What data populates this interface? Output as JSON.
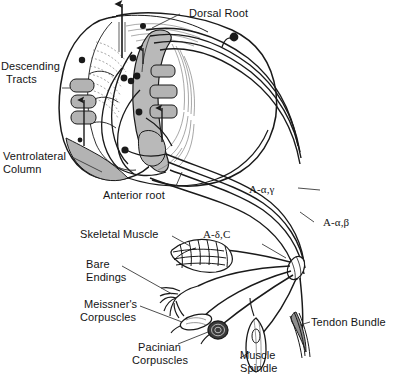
{
  "figure": {
    "ink_color": "#1a1a1a",
    "gray_matter_color": "#b9b9b9",
    "tract_fill_color": "#b3b3b3",
    "background_color": "#ffffff"
  },
  "labels": {
    "dorsal_root": "Dorsal Root",
    "descending_tracts_line1": "Descending",
    "descending_tracts_line2": "Tracts",
    "ventrolateral_column_line1": "Ventrolateral",
    "ventrolateral_column_line2": "Column",
    "anterior_root": "Anterior root",
    "a_alpha_gamma": "A-α,γ",
    "a_alpha_beta": "A-α,β",
    "a_delta_c": "A-δ,C",
    "skeletal_muscle": "Skeletal Muscle",
    "bare_endings_line1": "Bare",
    "bare_endings_line2": "Endings",
    "meissners_line1": "Meissner's",
    "meissners_line2": "Corpuscles",
    "pacinian_line1": "Pacinian",
    "pacinian_line2": "Corpuscles",
    "muscle_spindle_line1": "Muscle",
    "muscle_spindle_line2": "Spindle",
    "tendon_bundle": "Tendon Bundle"
  }
}
